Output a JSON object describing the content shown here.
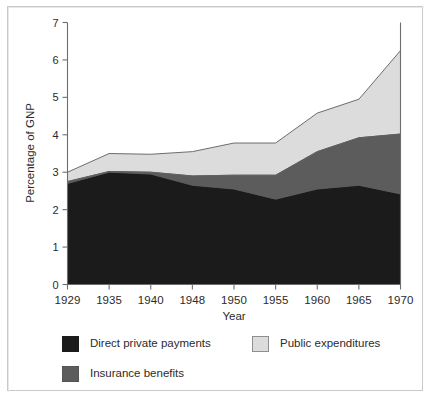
{
  "chart_data": {
    "type": "area",
    "stacked": true,
    "title": "",
    "subtitle": "",
    "xlabel": "Year",
    "ylabel": "Percentage of GNP",
    "categories": [
      "1929",
      "1935",
      "1940",
      "1948",
      "1950",
      "1955",
      "1960",
      "1965",
      "1970"
    ],
    "xticklabels": [
      "1929",
      "1935",
      "1940",
      "1948",
      "1950",
      "1955",
      "1960",
      "1965",
      "1970"
    ],
    "yticklabels": [
      "0",
      "1",
      "2",
      "3",
      "4",
      "5",
      "6",
      "7"
    ],
    "ylim": [
      0,
      7
    ],
    "ytick_step": 1,
    "grid": false,
    "legend_position": "bottom",
    "series": [
      {
        "name": "Direct private payments",
        "color": "#1b1b1b",
        "values": [
          2.7,
          3.0,
          2.95,
          2.65,
          2.55,
          2.28,
          2.55,
          2.65,
          2.42
        ]
      },
      {
        "name": "Insurance benefits",
        "color": "#5c5c5c",
        "values": [
          0.05,
          0.02,
          0.05,
          0.25,
          0.37,
          0.64,
          1.0,
          1.27,
          1.6
        ]
      },
      {
        "name": "Public expenditures",
        "color": "#dcdcdc",
        "values": [
          0.25,
          0.48,
          0.48,
          0.65,
          0.86,
          0.86,
          1.03,
          1.03,
          2.23
        ]
      }
    ],
    "cumulative_tops": {
      "direct_private_payments": [
        2.7,
        3.0,
        2.95,
        2.65,
        2.55,
        2.28,
        2.55,
        2.65,
        2.42
      ],
      "plus_insurance_benefits": [
        2.75,
        3.02,
        3.0,
        2.9,
        2.92,
        2.92,
        3.55,
        3.92,
        4.02
      ],
      "plus_public_expenditures": [
        3.0,
        3.5,
        3.48,
        3.55,
        3.78,
        3.78,
        4.58,
        4.95,
        6.25
      ]
    }
  },
  "axes": {
    "y_title": "Percentage of GNP",
    "x_title": "Year",
    "y_ticks": [
      "7",
      "6",
      "5",
      "4",
      "3",
      "2",
      "1",
      "0"
    ],
    "x_ticks": [
      "1929",
      "1935",
      "1940",
      "1948",
      "1950",
      "1955",
      "1960",
      "1965",
      "1970"
    ]
  },
  "legend": {
    "items": [
      {
        "label": "Direct private payments",
        "swatch": "black"
      },
      {
        "label": "Public expenditures",
        "swatch": "light"
      },
      {
        "label": "Insurance benefits",
        "swatch": "mid"
      }
    ]
  }
}
